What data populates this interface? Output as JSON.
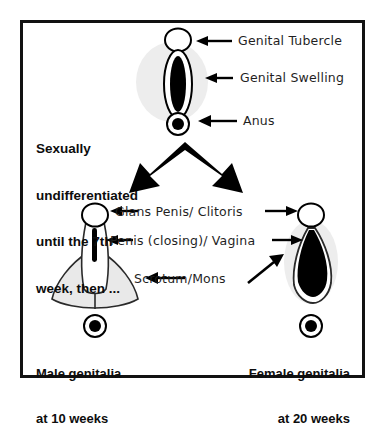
{
  "figure": {
    "border_color": "#121212",
    "background_color": "#ffffff",
    "ink_color": "#000000",
    "shadow_color": "#ededed",
    "fill_light_gray": "#e9e9e9"
  },
  "stages": {
    "undifferentiated": {
      "note": [
        "Sexually",
        "undifferentiated",
        "until the 7th",
        "week, then ..."
      ],
      "labels": [
        {
          "text": "Genital Tubercle",
          "arrow": "left"
        },
        {
          "text": "Genital Swelling",
          "arrow": "left"
        },
        {
          "text": "Anus",
          "arrow": "left"
        }
      ]
    },
    "differentiated": {
      "labels": [
        {
          "text": "Glans Penis/ Clitoris",
          "arrow": "both"
        },
        {
          "text": "Penis (closing)/ Vagina",
          "arrow": "both"
        },
        {
          "text": "Scrotum/Mons",
          "arrow": "both"
        }
      ],
      "male_caption": [
        "Male genitalia",
        "at 10 weeks"
      ],
      "female_caption": [
        "Female genitalia",
        "at 20 weeks"
      ]
    }
  },
  "icons": {
    "split_arrow": "double-branching-arrow",
    "pointer_left": "arrow-left-icon",
    "pointer_right": "arrow-right-icon",
    "pointer_diagonal": "arrow-up-right-icon"
  }
}
